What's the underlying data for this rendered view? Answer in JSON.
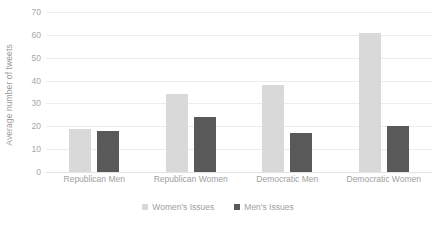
{
  "chart_data": {
    "type": "bar",
    "title": "",
    "subtitle": "",
    "xlabel": "",
    "ylabel": "Average number of tweets",
    "ylim": [
      0,
      70
    ],
    "yticks": [
      0,
      10,
      20,
      30,
      40,
      50,
      60,
      70
    ],
    "ytick_labels": [
      "0",
      "10",
      "20",
      "30",
      "40",
      "50",
      "60",
      "70"
    ],
    "grid": true,
    "legend_position": "bottom-center",
    "categories": [
      "Republican Men",
      "Republican Women",
      "Democratic Men",
      "Democratic Women"
    ],
    "series": [
      {
        "name": "Women's Issues",
        "color": "#d9d9d9",
        "values": [
          19,
          34,
          38,
          61
        ]
      },
      {
        "name": "Men's Issues",
        "color": "#595959",
        "values": [
          18,
          24,
          17,
          20
        ]
      }
    ]
  },
  "legend": {
    "items": [
      {
        "label": "Women's Issues",
        "swatch": "women"
      },
      {
        "label": "Men's Issues",
        "swatch": "men"
      }
    ]
  },
  "colors": {
    "womens_issues": "#d9d9d9",
    "mens_issues": "#595959",
    "gridline": "#ececed",
    "tick_text": "#a8a8a8",
    "axis_title_text": "#9a9a9a",
    "background": "#ffffff"
  }
}
